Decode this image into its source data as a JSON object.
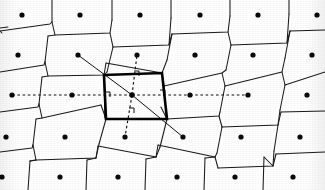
{
  "figure": {
    "background_color": "#ffffff",
    "ink_color": "#111111",
    "cell_stroke_color": "#000000",
    "width": 325,
    "height": 190
  },
  "chart_data": {
    "type": "scatter",
    "xlabel": "",
    "ylabel": "",
    "xlim": [
      0,
      325
    ],
    "ylim": [
      0,
      190
    ],
    "grid": false,
    "legend": null,
    "lattice": {
      "rows": 5,
      "columns": 6,
      "a1_vector": [
        58.6,
        -2.2
      ],
      "a2_vector": [
        -5.0,
        40.5
      ],
      "row_y": [
        15,
        55,
        95,
        137,
        177
      ],
      "row_x_start": [
        22,
        18,
        12,
        6,
        2
      ],
      "column_spacing": 58.8,
      "point_radius": 2.6
    },
    "points": [
      {
        "id": "p00",
        "x": 22,
        "y": 15
      },
      {
        "id": "p01",
        "x": 80,
        "y": 15
      },
      {
        "id": "p02",
        "x": 140,
        "y": 15
      },
      {
        "id": "p03",
        "x": 200,
        "y": 15
      },
      {
        "id": "p04",
        "x": 258,
        "y": 15
      },
      {
        "id": "p05",
        "x": 317,
        "y": 15
      },
      {
        "id": "p10",
        "x": 18,
        "y": 55
      },
      {
        "id": "p11",
        "x": 78,
        "y": 55
      },
      {
        "id": "p12",
        "x": 137,
        "y": 55
      },
      {
        "id": "p13",
        "x": 195,
        "y": 55
      },
      {
        "id": "p14",
        "x": 253,
        "y": 55
      },
      {
        "id": "p15",
        "x": 312,
        "y": 55
      },
      {
        "id": "p20",
        "x": 12,
        "y": 95
      },
      {
        "id": "p21",
        "x": 72,
        "y": 95
      },
      {
        "id": "p22",
        "x": 132,
        "y": 95
      },
      {
        "id": "p23",
        "x": 190,
        "y": 95
      },
      {
        "id": "p24",
        "x": 248,
        "y": 95
      },
      {
        "id": "p25",
        "x": 307,
        "y": 95
      },
      {
        "id": "p30",
        "x": 6,
        "y": 137
      },
      {
        "id": "p31",
        "x": 65,
        "y": 137
      },
      {
        "id": "p32",
        "x": 125,
        "y": 137
      },
      {
        "id": "p33",
        "x": 183,
        "y": 137
      },
      {
        "id": "p34",
        "x": 241,
        "y": 137
      },
      {
        "id": "p35",
        "x": 300,
        "y": 137
      },
      {
        "id": "p40",
        "x": 2,
        "y": 177
      },
      {
        "id": "p41",
        "x": 60,
        "y": 177
      },
      {
        "id": "p42",
        "x": 118,
        "y": 177
      },
      {
        "id": "p43",
        "x": 177,
        "y": 177
      },
      {
        "id": "p44",
        "x": 235,
        "y": 177
      },
      {
        "id": "p45",
        "x": 293,
        "y": 177
      }
    ],
    "central_point": {
      "id": "p22",
      "x": 132,
      "y": 95
    },
    "wigner_seitz_cell": {
      "label": "central Wigner-Seitz cell",
      "vertices": [
        [
          104,
          75
        ],
        [
          162,
          73
        ],
        [
          167,
          119
        ],
        [
          106,
          119
        ]
      ],
      "stroke_width": 2.6,
      "closed": true
    },
    "neighbour_connectors": [
      {
        "from": "p22",
        "to": "p21",
        "style": "dashed",
        "x1": 132,
        "y1": 95,
        "x2": 72,
        "y2": 95
      },
      {
        "from": "p22",
        "to": "p23",
        "style": "dashed",
        "x1": 132,
        "y1": 95,
        "x2": 190,
        "y2": 95
      },
      {
        "from": "p22",
        "to": "p12",
        "style": "dashed",
        "x1": 132,
        "y1": 95,
        "x2": 137,
        "y2": 55
      },
      {
        "from": "p22",
        "to": "p32",
        "style": "dashed",
        "x1": 132,
        "y1": 95,
        "x2": 125,
        "y2": 137
      },
      {
        "from": "p22",
        "to": "p11",
        "style": "solid",
        "x1": 132,
        "y1": 95,
        "x2": 78,
        "y2": 55
      },
      {
        "from": "p22",
        "to": "p33",
        "style": "solid",
        "x1": 132,
        "y1": 95,
        "x2": 183,
        "y2": 137
      }
    ],
    "extended_connectors": [
      {
        "from": "p21",
        "to": "p20",
        "style": "dashed",
        "x1": 72,
        "y1": 95,
        "x2": 12,
        "y2": 95
      },
      {
        "from": "p23",
        "to": "p24",
        "style": "dashed",
        "x1": 190,
        "y1": 95,
        "x2": 248,
        "y2": 95
      }
    ],
    "right_angle_marks": [
      {
        "at_edge": "left",
        "x": 105,
        "y": 97,
        "rotation": 0
      },
      {
        "at_edge": "right",
        "x": 160,
        "y": 95,
        "rotation": 0
      },
      {
        "at_edge": "top",
        "x": 134,
        "y": 76,
        "rotation": 0
      },
      {
        "at_edge": "bottom",
        "x": 129,
        "y": 113,
        "rotation": 0
      }
    ],
    "voronoi_edges": [
      {
        "path": "M 0 28 L 8 27"
      },
      {
        "path": "M 52 22 L 52 0"
      },
      {
        "path": "M 112 20 L 112 0"
      },
      {
        "path": "M 171 18 L 171 0"
      },
      {
        "path": "M 230 16 L 230 0"
      },
      {
        "path": "M 289 14 L 289 0"
      },
      {
        "path": "M 0 31 L 50 24 L 52 22"
      },
      {
        "path": "M 52 22 L 55 35 L 48 36"
      },
      {
        "path": "M 55 35 L 110 33 L 112 20"
      },
      {
        "path": "M 110 33 L 113 47"
      },
      {
        "path": "M 113 47 L 169 45 L 171 18"
      },
      {
        "path": "M 169 45 L 172 34"
      },
      {
        "path": "M 172 34 L 228 32 L 230 16"
      },
      {
        "path": "M 228 32 L 231 45"
      },
      {
        "path": "M 231 45 L 287 43 L 289 14"
      },
      {
        "path": "M 287 43 L 290 31"
      },
      {
        "path": "M 290 31 L 325 30"
      },
      {
        "path": "M 48 36 L 45 62"
      },
      {
        "path": "M 0 31 L 2 33"
      },
      {
        "path": "M 113 47 L 107 72"
      },
      {
        "path": "M 172 34 L 167 60"
      },
      {
        "path": "M 231 45 L 226 70"
      },
      {
        "path": "M 290 31 L 285 58"
      },
      {
        "path": "M 0 72 L 44 65 L 45 62"
      },
      {
        "path": "M 45 62 L 48 76 L 42 77"
      },
      {
        "path": "M 48 76 L 104 75 L 107 72"
      },
      {
        "path": "M 104 75 L 106 63"
      },
      {
        "path": "M 106 63 L 162 73 L 167 60"
      },
      {
        "path": "M 162 73 L 164 86"
      },
      {
        "path": "M 164 86 L 222 73 L 226 70"
      },
      {
        "path": "M 222 73 L 225 86"
      },
      {
        "path": "M 225 86 L 282 72 L 285 58"
      },
      {
        "path": "M 282 72 L 285 85"
      },
      {
        "path": "M 285 85 L 325 72"
      },
      {
        "path": "M 42 77 L 39 104"
      },
      {
        "path": "M 106 119 L 101 105"
      },
      {
        "path": "M 167 119 L 161 107"
      },
      {
        "path": "M 225 86 L 220 112"
      },
      {
        "path": "M 285 85 L 280 110"
      },
      {
        "path": "M 0 112 L 38 107 L 39 104"
      },
      {
        "path": "M 39 104 L 42 118 L 36 119"
      },
      {
        "path": "M 42 118 L 101 105"
      },
      {
        "path": "M 104 75 L 105 118"
      },
      {
        "path": "M 106 119 L 104 75"
      },
      {
        "path": "M 167 119 L 162 73"
      },
      {
        "path": "M 106 119 L 167 119"
      },
      {
        "path": "M 167 119 L 219 116 L 220 112"
      },
      {
        "path": "M 219 116 L 222 127"
      },
      {
        "path": "M 222 127 L 278 125 L 280 110"
      },
      {
        "path": "M 278 125 L 281 112"
      },
      {
        "path": "M 281 112 L 325 111"
      },
      {
        "path": "M 36 119 L 33 145"
      },
      {
        "path": "M 106 119 L 99 144"
      },
      {
        "path": "M 167 119 L 160 147"
      },
      {
        "path": "M 222 127 L 217 153"
      },
      {
        "path": "M 278 125 L 274 151"
      },
      {
        "path": "M 0 152 L 32 148 L 33 145"
      },
      {
        "path": "M 33 145 L 36 160 L 30 161"
      },
      {
        "path": "M 36 160 L 96 158 L 99 144"
      },
      {
        "path": "M 96 158 L 98 146"
      },
      {
        "path": "M 98 146 L 156 157 L 160 147"
      },
      {
        "path": "M 156 157 L 158 145"
      },
      {
        "path": "M 158 145 L 215 157 L 217 153"
      },
      {
        "path": "M 215 157 L 218 168"
      },
      {
        "path": "M 218 168 L 273 166 L 274 151"
      },
      {
        "path": "M 273 166 L 276 154"
      },
      {
        "path": "M 276 154 L 325 152"
      },
      {
        "path": "M 30 161 L 28 190"
      },
      {
        "path": "M 87 160 L 86 190"
      },
      {
        "path": "M 146 159 L 145 190"
      },
      {
        "path": "M 205 158 L 204 190"
      },
      {
        "path": "M 264 157 L 263 190"
      },
      {
        "path": "M 36 160 L 30 161"
      },
      {
        "path": "M 96 158 L 87 160"
      },
      {
        "path": "M 156 157 L 146 159"
      },
      {
        "path": "M 215 157 L 205 158"
      },
      {
        "path": "M 273 166 L 264 157"
      }
    ]
  }
}
